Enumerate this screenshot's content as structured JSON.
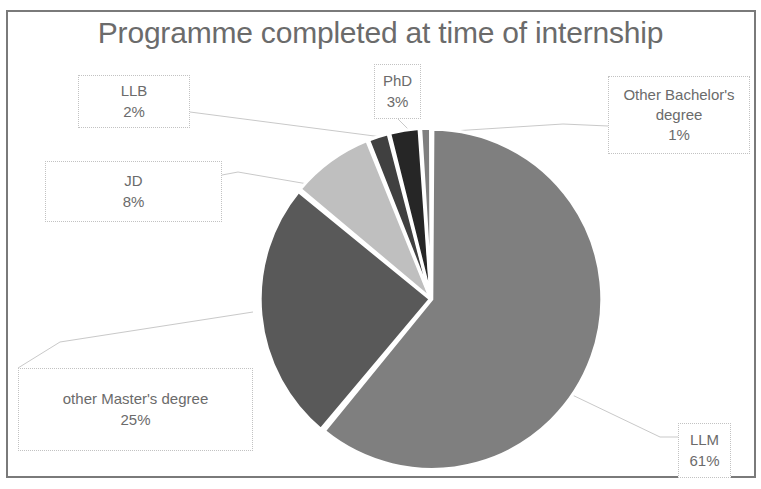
{
  "chart_data": {
    "type": "pie",
    "title": "Programme completed at time of internship",
    "categories": [
      "LLM",
      "other Master's degree",
      "JD",
      "LLB",
      "PhD",
      "Other Bachelor's degree"
    ],
    "values": [
      61,
      25,
      8,
      2,
      3,
      1
    ],
    "value_labels": [
      "61%",
      "25%",
      "8%",
      "2%",
      "3%",
      "1%"
    ],
    "unit": "%",
    "legend": "none",
    "labels_position": "outside-callout-boxes",
    "grid": false,
    "slices": [
      {
        "name": "LLM",
        "label": "LLM",
        "percent": 61,
        "percent_label": "61%",
        "color": "#7f7f7f",
        "start_deg": 0,
        "end_deg": 219.6
      },
      {
        "name": "other Masters degree",
        "label": "other Master's degree",
        "percent": 25,
        "percent_label": "25%",
        "color": "#595959",
        "start_deg": 219.6,
        "end_deg": 309.6
      },
      {
        "name": "JD",
        "label": "JD",
        "percent": 8,
        "percent_label": "8%",
        "color": "#bfbfbf",
        "start_deg": 309.6,
        "end_deg": 338.4
      },
      {
        "name": "LLB",
        "label": "LLB",
        "percent": 2,
        "percent_label": "2%",
        "color": "#404040",
        "start_deg": 338.4,
        "end_deg": 345.6
      },
      {
        "name": "PhD",
        "label": "PhD",
        "percent": 3,
        "percent_label": "3%",
        "color": "#262626",
        "start_deg": 345.6,
        "end_deg": 356.4
      },
      {
        "name": "Other Bachelors degree",
        "label": "Other Bachelor's degree",
        "percent": 1,
        "percent_label": "1%",
        "color": "#7f7f7f",
        "start_deg": 356.4,
        "end_deg": 360
      }
    ]
  },
  "callouts": {
    "llb": {
      "label": "LLB",
      "percent": "2%"
    },
    "jd": {
      "label": "JD",
      "percent": "8%"
    },
    "phd": {
      "label": "PhD",
      "percent": "3%"
    },
    "bachelor": {
      "label_line1": "Other Bachelor's",
      "label_line2": "degree",
      "percent": "1%"
    },
    "masters": {
      "label": "other Master's degree",
      "percent": "25%"
    },
    "llm": {
      "label": "LLM",
      "percent": "61%"
    }
  }
}
